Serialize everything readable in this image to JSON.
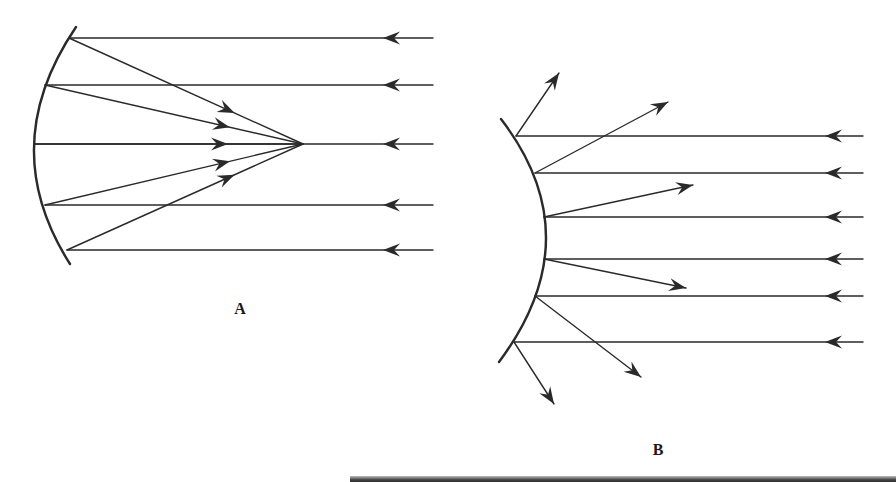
{
  "figure": {
    "stroke_color": "#2a2a2a",
    "background": "#ffffff"
  },
  "diagram_a": {
    "label": "A",
    "label_pos": [
      240,
      314
    ],
    "mirror_type": "concave",
    "mirror": {
      "top": [
        76,
        27
      ],
      "vertex": [
        34,
        146
      ],
      "bottom": [
        70,
        264
      ]
    },
    "focus": [
      303,
      144
    ],
    "incident_start_x": 433,
    "incident_arrow_x": 383,
    "rays": [
      {
        "y": 38,
        "hit": [
          69,
          38
        ]
      },
      {
        "y": 85,
        "hit": [
          45,
          85
        ]
      },
      {
        "y": 144,
        "hit": [
          34,
          144
        ]
      },
      {
        "y": 205,
        "hit": [
          45,
          205
        ]
      },
      {
        "y": 250,
        "hit": [
          67,
          250
        ]
      }
    ]
  },
  "diagram_b": {
    "label": "B",
    "label_pos": [
      658,
      455
    ],
    "mirror_type": "convex",
    "mirror": {
      "top": [
        501,
        119
      ],
      "apex": [
        546,
        239
      ],
      "bottom": [
        499,
        362
      ]
    },
    "incident_start_x": 863,
    "incident_arrow_x": 825,
    "rays": [
      {
        "y": 136,
        "hit": [
          516,
          136
        ],
        "reflected_end": [
          559,
          73
        ]
      },
      {
        "y": 173,
        "hit": [
          535,
          173
        ],
        "reflected_end": [
          668,
          102
        ]
      },
      {
        "y": 217,
        "hit": [
          544,
          217
        ],
        "reflected_end": [
          693,
          185
        ]
      },
      {
        "y": 259,
        "hit": [
          544,
          259
        ],
        "reflected_end": [
          686,
          288
        ]
      },
      {
        "y": 296,
        "hit": [
          535,
          296
        ],
        "reflected_end": [
          641,
          377
        ]
      },
      {
        "y": 342,
        "hit": [
          514,
          342
        ],
        "reflected_end": [
          554,
          404
        ]
      }
    ]
  }
}
